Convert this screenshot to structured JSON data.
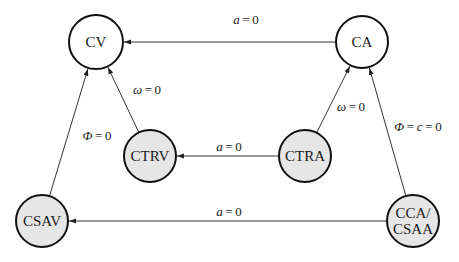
{
  "diagram": {
    "type": "state-transition",
    "colors": {
      "stroke": "#111111",
      "edge": "#333333",
      "fill_plain": "#ffffff",
      "fill_shaded": "#e6e6e6"
    },
    "nodes": [
      {
        "id": "CV",
        "label": "CV",
        "lines": [
          "CV"
        ],
        "x": 96,
        "y": 42,
        "r": 27,
        "shaded": false
      },
      {
        "id": "CA",
        "label": "CA",
        "lines": [
          "CA"
        ],
        "x": 362,
        "y": 42,
        "r": 26,
        "shaded": false
      },
      {
        "id": "CTRV",
        "label": "CTRV",
        "lines": [
          "CTRV"
        ],
        "x": 150,
        "y": 156,
        "r": 26,
        "shaded": true
      },
      {
        "id": "CTRA",
        "label": "CTRA",
        "lines": [
          "CTRA"
        ],
        "x": 305,
        "y": 156,
        "r": 26,
        "shaded": true
      },
      {
        "id": "CSAV",
        "label": "CSAV",
        "lines": [
          "CSAV"
        ],
        "x": 42,
        "y": 221,
        "r": 26,
        "shaded": true
      },
      {
        "id": "CCA_CSAA",
        "label": "CCA/CSAA",
        "lines": [
          "CCA/",
          "CSAA"
        ],
        "x": 413,
        "y": 221,
        "r": 26,
        "shaded": true
      }
    ],
    "edges": [
      {
        "from": "CA",
        "to": "CV",
        "label": "a=0",
        "label_x": 246,
        "label_y": 24
      },
      {
        "from": "CTRV",
        "to": "CV",
        "label": "ω=0",
        "label_x": 147,
        "label_y": 94
      },
      {
        "from": "CSAV",
        "to": "CV",
        "label": "Φ=0",
        "label_x": 97,
        "label_y": 140
      },
      {
        "from": "CTRA",
        "to": "CTRV",
        "label": "a=0",
        "label_x": 229,
        "label_y": 151
      },
      {
        "from": "CTRA",
        "to": "CA",
        "label": "ω=0",
        "label_x": 351,
        "label_y": 111
      },
      {
        "from": "CCA_CSAA",
        "to": "CA",
        "label": "Φ=c=0",
        "label_x": 418,
        "label_y": 131
      },
      {
        "from": "CCA_CSAA",
        "to": "CSAV",
        "label": "a=0",
        "label_x": 229,
        "label_y": 216
      }
    ]
  }
}
